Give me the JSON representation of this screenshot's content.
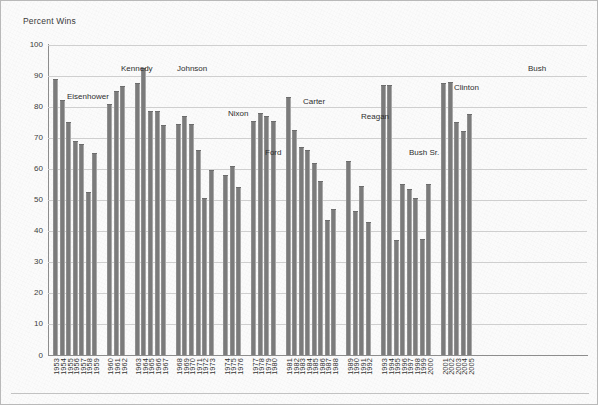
{
  "figure": {
    "y_axis_title": "Percent Wins",
    "y_ticks": [
      "100",
      "90",
      "80",
      "70",
      "60",
      "50",
      "40",
      "30",
      "20",
      "10",
      "0"
    ],
    "bar_color": "#7b7b7b",
    "grid_color": "#cfcfcf",
    "axis_color": "#8d8d8d",
    "background": "#fbfbfb"
  },
  "annotations": [
    {
      "label": "Eisenhower",
      "x": 66,
      "y": 91
    },
    {
      "label": "Kennedy",
      "x": 120,
      "y": 63
    },
    {
      "label": "Johnson",
      "x": 176,
      "y": 63
    },
    {
      "label": "Nixon",
      "x": 227,
      "y": 108
    },
    {
      "label": "Ford",
      "x": 264,
      "y": 147
    },
    {
      "label": "Carter",
      "x": 302,
      "y": 96
    },
    {
      "label": "Reagan",
      "x": 360,
      "y": 111
    },
    {
      "label": "Bush Sr.",
      "x": 408,
      "y": 147
    },
    {
      "label": "Clinton",
      "x": 453,
      "y": 82
    },
    {
      "label": "Bush",
      "x": 527,
      "y": 63
    }
  ],
  "chart_data": {
    "type": "bar",
    "title": "",
    "subtitle": "",
    "xlabel": "",
    "ylabel": "Percent Wins",
    "ylim": [
      0,
      100
    ],
    "ytick_interval": 10,
    "grid": true,
    "legend": null,
    "groups": [
      {
        "president": "Eisenhower",
        "years": [
          1953,
          1954,
          1955,
          1956,
          1957,
          1958,
          1959
        ]
      },
      {
        "president": "Kennedy",
        "years": [
          1960,
          1961,
          1962
        ]
      },
      {
        "president": "Johnson",
        "years": [
          1963,
          1964,
          1965,
          1966,
          1967
        ]
      },
      {
        "president": "Nixon",
        "years": [
          1968,
          1969,
          1970,
          1971,
          1972,
          1973
        ]
      },
      {
        "president": "Ford",
        "years": [
          1974,
          1975,
          1976
        ]
      },
      {
        "president": "Carter",
        "years": [
          1977,
          1978,
          1979,
          1980
        ]
      },
      {
        "president": "Reagan",
        "years": [
          1981,
          1982,
          1983,
          1984,
          1985,
          1986,
          1987,
          1988
        ]
      },
      {
        "president": "Bush Sr.",
        "years": [
          1989,
          1990,
          1991,
          1992
        ]
      },
      {
        "president": "Clinton",
        "years": [
          1993,
          1994,
          1995,
          1996,
          1997,
          1998,
          1999,
          2000
        ]
      },
      {
        "president": "Bush",
        "years": [
          2001,
          2002,
          2003,
          2004,
          2005
        ]
      }
    ],
    "categories": [
      "1953",
      "1954",
      "1955",
      "1956",
      "1957",
      "1958",
      "1959",
      "1960",
      "1961",
      "1962",
      "1963",
      "1964",
      "1965",
      "1966",
      "1967",
      "1968",
      "1969",
      "1970",
      "1971",
      "1972",
      "1973",
      "1974",
      "1975",
      "1976",
      "1977",
      "1978",
      "1979",
      "1980",
      "1981",
      "1982",
      "1983",
      "1984",
      "1985",
      "1986",
      "1987",
      "1988",
      "1989",
      "1990",
      "1991",
      "1992",
      "1993",
      "1994",
      "1995",
      "1996",
      "1997",
      "1998",
      "1999",
      "2000",
      "2001",
      "2002",
      "2003",
      "2004",
      "2005"
    ],
    "values": [
      89,
      82,
      75,
      69,
      68,
      52.5,
      65,
      81,
      85,
      86.5,
      87.5,
      92.5,
      78.5,
      78.5,
      74,
      74.5,
      77,
      74.5,
      66,
      50.5,
      59.5,
      58,
      61,
      54,
      75.5,
      78,
      77,
      75.5,
      83,
      72.5,
      67,
      66,
      62,
      56,
      43.5,
      47,
      62.5,
      46.5,
      54.5,
      43,
      87,
      87,
      37,
      55,
      53.5,
      50.5,
      37.5,
      55,
      87.5,
      88,
      75,
      72,
      77.5
    ]
  }
}
